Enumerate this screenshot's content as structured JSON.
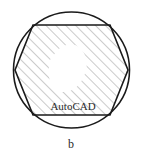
{
  "figure": {
    "caption": "b",
    "inner_text": "AutoCAD",
    "stroke_color": "#1a1a1a",
    "hatch_color": "#8c8c8c",
    "background_color": "#ffffff",
    "shapes": {
      "circle": {
        "name": "outer-circle",
        "cx": 71.5,
        "cy": 70,
        "r": 58,
        "stroke_width": 1.6
      },
      "hexagon": {
        "name": "inscribed-hexagon",
        "points": "15,70 33,25 110,25 128,70 110,115 33,115",
        "stroke_width": 1.6,
        "vertices": [
          {
            "label": "left",
            "x": 15,
            "y": 70
          },
          {
            "label": "top-left",
            "x": 33,
            "y": 25
          },
          {
            "label": "top-right",
            "x": 110,
            "y": 25
          },
          {
            "label": "right",
            "x": 128,
            "y": 70
          },
          {
            "label": "bottom-right",
            "x": 110,
            "y": 115
          },
          {
            "label": "bottom-left",
            "x": 33,
            "y": 115
          }
        ]
      },
      "void_blob": {
        "name": "unhatched-center-void",
        "path": "M 56 52 C 62 44, 74 42, 80 48 C 86 54, 88 62, 86 70 C 84 78, 80 86, 72 90 C 64 94, 56 92, 52 86 C 48 80, 48 68, 50 60 Z"
      }
    },
    "hatch": {
      "name": "diagonal-hatch-pattern",
      "angle_deg": 45,
      "spacing_px": 7,
      "line_width": 0.9
    },
    "inner_text_pos": {
      "x": 73,
      "y": 110
    },
    "caption_pos": {
      "x": 71,
      "y": 148
    }
  }
}
